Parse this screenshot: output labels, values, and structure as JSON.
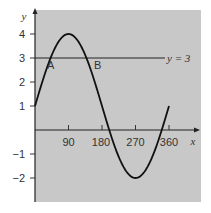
{
  "chart_data": {
    "type": "line",
    "title": "",
    "xlabel": "x",
    "ylabel": "y",
    "xlim": [
      0,
      360
    ],
    "ylim": [
      -2,
      4
    ],
    "x_ticks": [
      90,
      180,
      270,
      360
    ],
    "y_ticks": [
      -2,
      -1,
      1,
      2,
      3,
      4
    ],
    "grid": false,
    "background": "#c8c8c8",
    "series": [
      {
        "name": "y = 1 + 3sin x",
        "x": [
          0,
          30,
          60,
          90,
          120,
          150,
          180,
          210,
          240,
          270,
          300,
          330,
          360
        ],
        "values": [
          1,
          2.5,
          3.6,
          4,
          3.6,
          2.5,
          1,
          -0.5,
          -1.6,
          -2,
          -1.6,
          -0.5,
          1
        ],
        "color": "#111111"
      },
      {
        "name": "y = 3",
        "x": [
          0,
          360
        ],
        "values": [
          3,
          3
        ],
        "color": "#111111"
      }
    ],
    "annotations": [
      {
        "text": "A",
        "x": 41.8,
        "y": 3
      },
      {
        "text": "B",
        "x": 138.2,
        "y": 3
      },
      {
        "text": "y = 3",
        "x": 380,
        "y": 3
      }
    ]
  },
  "labels": {
    "x_axis": "x",
    "y_axis": "y",
    "line_label": "y = 3",
    "point_a": "A",
    "point_b": "B",
    "x_ticks": [
      "90",
      "180",
      "270",
      "360"
    ],
    "y_ticks": [
      "4",
      "3",
      "2",
      "1",
      "−1",
      "−2"
    ]
  }
}
